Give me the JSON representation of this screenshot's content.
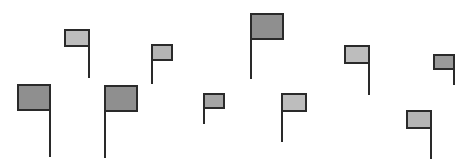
{
  "scene": {
    "background": "#ffffff",
    "stroke": "#2a2a2a",
    "flag_count": 10,
    "flags": [
      {
        "id": 1,
        "box": [
          18,
          85,
          32,
          25
        ],
        "pole_side": "right",
        "pole_bottom": 157,
        "fill": "#8f8f8f"
      },
      {
        "id": 2,
        "box": [
          65,
          30,
          24,
          16
        ],
        "pole_side": "right",
        "pole_bottom": 78,
        "fill": "#bdbdbd"
      },
      {
        "id": 3,
        "box": [
          105,
          86,
          32,
          25
        ],
        "pole_side": "left",
        "pole_bottom": 158,
        "fill": "#8f8f8f"
      },
      {
        "id": 4,
        "box": [
          152,
          45,
          20,
          15
        ],
        "pole_side": "left",
        "pole_bottom": 84,
        "fill": "#b5b5b5"
      },
      {
        "id": 5,
        "box": [
          204,
          94,
          20,
          14
        ],
        "pole_side": "left",
        "pole_bottom": 124,
        "fill": "#a5a5a5"
      },
      {
        "id": 6,
        "box": [
          251,
          14,
          32,
          25
        ],
        "pole_side": "left",
        "pole_bottom": 79,
        "fill": "#8f8f8f"
      },
      {
        "id": 7,
        "box": [
          282,
          94,
          24,
          17
        ],
        "pole_side": "left",
        "pole_bottom": 142,
        "fill": "#bdbdbd"
      },
      {
        "id": 8,
        "box": [
          345,
          46,
          24,
          17
        ],
        "pole_side": "right",
        "pole_bottom": 95,
        "fill": "#bdbdbd"
      },
      {
        "id": 9,
        "box": [
          434,
          55,
          20,
          14
        ],
        "pole_side": "right",
        "pole_bottom": 85,
        "fill": "#9a9a9a"
      },
      {
        "id": 10,
        "box": [
          407,
          111,
          24,
          17
        ],
        "pole_side": "right",
        "pole_bottom": 159,
        "fill": "#b5b5b5"
      }
    ]
  }
}
